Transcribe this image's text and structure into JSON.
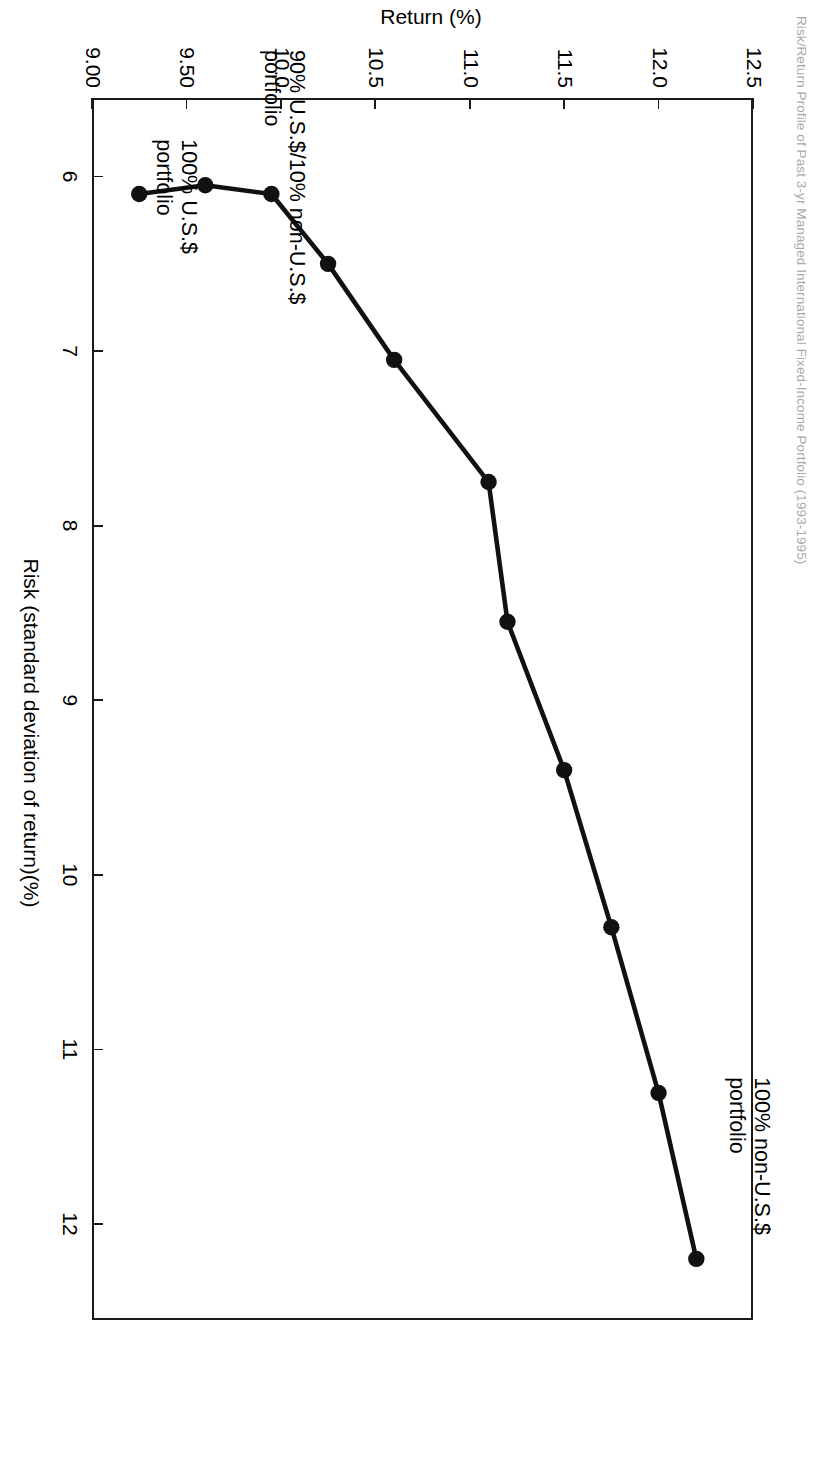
{
  "figure": {
    "title": "Risk/Return Profile of Past 3-yr Managed International Fixed-Income Portfolio (1993-1995)",
    "background": "#ffffff",
    "line_color": "#111111",
    "marker_color": "#111111"
  },
  "chart_data": {
    "type": "line",
    "title": "Risk/Return Profile of Past 3-yr Managed International Fixed-Income Portfolio (1993-1995)",
    "xlabel": "Risk (standard deviation of return)(%)",
    "ylabel": "Return (%)",
    "xlim": [
      5.55,
      12.55
    ],
    "ylim": [
      9.0,
      12.5
    ],
    "xticks": [
      6,
      7,
      8,
      9,
      10,
      11,
      12
    ],
    "xticklabels": [
      "6",
      "7",
      "8",
      "9",
      "10",
      "11",
      "12"
    ],
    "yticks": [
      9.0,
      9.5,
      10.0,
      10.5,
      11.0,
      11.5,
      12.0,
      12.5
    ],
    "yticklabels": [
      "9.00",
      "9.50",
      "10.0",
      "10.5",
      "11.0",
      "11.5",
      "12.0",
      "12.5"
    ],
    "grid": false,
    "legend": null,
    "markers": "filled-circle",
    "series": [
      {
        "name": "Efficient frontier",
        "x": [
          6.1,
          6.05,
          6.1,
          6.5,
          7.05,
          7.75,
          8.55,
          9.4,
          10.3,
          11.25,
          12.2
        ],
        "y": [
          9.25,
          9.6,
          9.95,
          10.25,
          10.6,
          11.1,
          11.2,
          11.5,
          11.75,
          12.0,
          12.2
        ]
      }
    ],
    "annotations": [
      {
        "text": "100% non-U.S.$\nportfolio",
        "x": 12.2,
        "y": 12.2
      },
      {
        "text": "90% U.S.$/10% non-U.S.$\nportfolio",
        "x": 6.05,
        "y": 9.6
      },
      {
        "text": "100% U.S.$\nportfolio",
        "x": 6.1,
        "y": 9.25
      }
    ]
  }
}
